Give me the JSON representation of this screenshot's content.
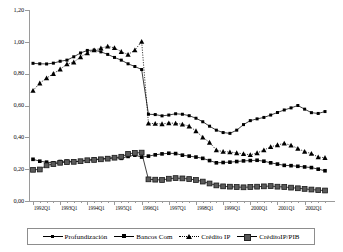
{
  "chart_data": {
    "type": "line",
    "title": "",
    "xlabel": "",
    "ylabel": "",
    "ylim": [
      0.0,
      1.2
    ],
    "ytick_labels": [
      "0,00",
      "0,20",
      "0,40",
      "0,60",
      "0,80",
      "1,00",
      "1,20"
    ],
    "ytick_values": [
      0.0,
      0.2,
      0.4,
      0.6,
      0.8,
      1.0,
      1.2
    ],
    "grid": false,
    "legend_position": "bottom",
    "x": [
      "1992Q1",
      "1992Q2",
      "1992Q3",
      "1992Q4",
      "1993Q1",
      "1993Q2",
      "1993Q3",
      "1993Q4",
      "1994Q1",
      "1994Q2",
      "1994Q3",
      "1994Q4",
      "1995Q1",
      "1995Q2",
      "1995Q3",
      "1995Q4",
      "1996Q1",
      "1996Q2",
      "1996Q3",
      "1996Q4",
      "1997Q1",
      "1997Q2",
      "1997Q3",
      "1997Q4",
      "1998Q1",
      "1998Q2",
      "1998Q3",
      "1998Q4",
      "1999Q1",
      "1999Q2",
      "1999Q3",
      "1999Q4",
      "2000Q1",
      "2000Q2",
      "2000Q3",
      "2000Q4",
      "2001Q1",
      "2001Q2",
      "2001Q3",
      "2001Q4",
      "2002Q1",
      "2002Q2",
      "2002Q3",
      "2002Q4"
    ],
    "xtick_labels": [
      "1992Q1",
      "1993Q1",
      "1994Q1",
      "1995Q1",
      "1996Q1",
      "1997Q1",
      "1998Q1",
      "1999Q1",
      "2000Q1",
      "2001Q1",
      "2002Q1"
    ],
    "xtick_index": [
      0,
      4,
      8,
      12,
      16,
      20,
      24,
      28,
      32,
      36,
      40
    ],
    "series": [
      {
        "name": "Profundización",
        "marker": "square-small",
        "line": "solid",
        "values": [
          0.865,
          0.862,
          0.861,
          0.866,
          0.878,
          0.885,
          0.906,
          0.93,
          0.946,
          0.948,
          0.937,
          0.921,
          0.902,
          0.885,
          0.862,
          0.845,
          0.826,
          0.545,
          0.543,
          0.535,
          0.54,
          0.548,
          0.545,
          0.536,
          0.52,
          0.498,
          0.47,
          0.445,
          0.43,
          0.425,
          0.445,
          0.48,
          0.505,
          0.516,
          0.525,
          0.54,
          0.556,
          0.572,
          0.585,
          0.6,
          0.577,
          0.555,
          0.55,
          0.562
        ]
      },
      {
        "name": "Bancos Com",
        "marker": "square",
        "line": "solid",
        "values": [
          0.262,
          0.25,
          0.244,
          0.24,
          0.248,
          0.25,
          0.248,
          0.25,
          0.256,
          0.262,
          0.264,
          0.268,
          0.272,
          0.268,
          0.28,
          0.288,
          0.276,
          0.282,
          0.29,
          0.296,
          0.3,
          0.298,
          0.288,
          0.282,
          0.276,
          0.268,
          0.254,
          0.24,
          0.242,
          0.244,
          0.248,
          0.252,
          0.254,
          0.256,
          0.25,
          0.24,
          0.232,
          0.224,
          0.222,
          0.218,
          0.214,
          0.21,
          0.2,
          0.19
        ]
      },
      {
        "name": "Crédito IP",
        "marker": "triangle",
        "line": "dotted",
        "values": [
          0.694,
          0.74,
          0.772,
          0.8,
          0.828,
          0.86,
          0.872,
          0.905,
          0.93,
          0.948,
          0.96,
          0.972,
          0.962,
          0.938,
          0.92,
          0.948,
          1.002,
          0.488,
          0.486,
          0.484,
          0.49,
          0.488,
          0.482,
          0.47,
          0.44,
          0.4,
          0.368,
          0.32,
          0.31,
          0.308,
          0.302,
          0.296,
          0.29,
          0.302,
          0.32,
          0.34,
          0.352,
          0.362,
          0.35,
          0.33,
          0.31,
          0.298,
          0.276,
          0.272
        ]
      },
      {
        "name": "CréditoIP/PIB",
        "marker": "square-large",
        "line": "solid",
        "values": [
          0.196,
          0.198,
          0.224,
          0.232,
          0.24,
          0.244,
          0.246,
          0.25,
          0.256,
          0.258,
          0.262,
          0.266,
          0.272,
          0.278,
          0.296,
          0.302,
          0.304,
          0.136,
          0.134,
          0.132,
          0.14,
          0.144,
          0.142,
          0.138,
          0.132,
          0.122,
          0.11,
          0.098,
          0.092,
          0.09,
          0.088,
          0.086,
          0.088,
          0.09,
          0.092,
          0.094,
          0.09,
          0.088,
          0.084,
          0.08,
          0.076,
          0.072,
          0.068,
          0.066
        ]
      }
    ]
  },
  "legend": {
    "items": [
      {
        "label": "Profundización",
        "marker": "square-small-icon"
      },
      {
        "label": "Bancos Com",
        "marker": "square-icon"
      },
      {
        "label": "Crédito IP",
        "marker": "triangle-icon"
      },
      {
        "label": "CréditoIP/PIB",
        "marker": "square-large-icon"
      }
    ]
  },
  "colors": {
    "axis": "#9a9a9a",
    "series": "#000000",
    "legend_border": "#8d8d8d",
    "background": "#ffffff"
  }
}
